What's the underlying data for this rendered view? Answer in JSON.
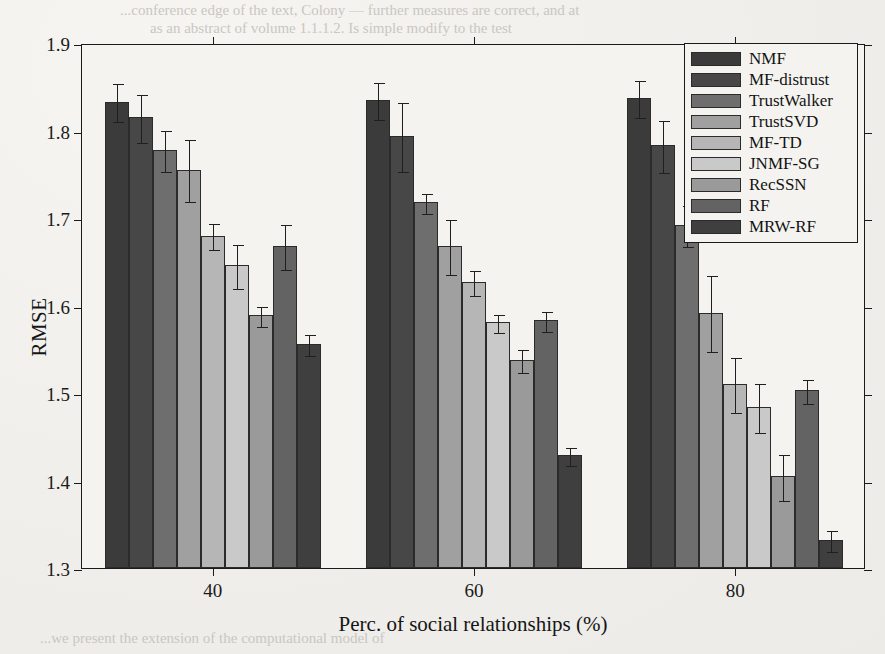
{
  "chart_data": {
    "type": "bar",
    "title": "",
    "xlabel": "Perc. of social relationships (%)",
    "ylabel": "RMSE",
    "ylim": [
      1.3,
      1.9
    ],
    "yticks": [
      "1.3",
      "1.4",
      "1.5",
      "1.6",
      "1.7",
      "1.8",
      "1.9"
    ],
    "categories": [
      "40",
      "60",
      "80"
    ],
    "grid": false,
    "legend_position": "top-right",
    "errorbars": true,
    "series": [
      {
        "name": "NMF",
        "color": "#3b3b3b",
        "values": [
          1.833,
          1.835,
          1.837
        ],
        "errors": [
          0.022,
          0.022,
          0.022
        ]
      },
      {
        "name": "MF-distrust",
        "color": "#474747",
        "values": [
          1.815,
          1.794,
          1.783
        ],
        "errors": [
          0.028,
          0.04,
          0.03
        ]
      },
      {
        "name": "TrustWalker",
        "color": "#6e6e6e",
        "values": [
          1.778,
          1.718,
          1.692
        ],
        "errors": [
          0.024,
          0.012,
          0.024
        ]
      },
      {
        "name": "TrustSVD",
        "color": "#a0a0a0",
        "values": [
          1.755,
          1.668,
          1.592
        ],
        "errors": [
          0.036,
          0.032,
          0.044
        ]
      },
      {
        "name": "MF-TD",
        "color": "#b6b6b6",
        "values": [
          1.68,
          1.627,
          1.51
        ],
        "errors": [
          0.015,
          0.015,
          0.032
        ]
      },
      {
        "name": "JNMF-SG",
        "color": "#c9c9c9",
        "values": [
          1.646,
          1.581,
          1.484
        ],
        "errors": [
          0.026,
          0.011,
          0.029
        ]
      },
      {
        "name": "RecSSN",
        "color": "#9a9a9a",
        "values": [
          1.589,
          1.538,
          1.405
        ],
        "errors": [
          0.012,
          0.014,
          0.027
        ]
      },
      {
        "name": "RF",
        "color": "#636363",
        "values": [
          1.668,
          1.583,
          1.503
        ],
        "errors": [
          0.026,
          0.012,
          0.014
        ]
      },
      {
        "name": "MRW-RF",
        "color": "#3f3f3f",
        "values": [
          1.556,
          1.429,
          1.332
        ],
        "errors": [
          0.013,
          0.011,
          0.013
        ]
      }
    ]
  },
  "page": {
    "ghost_top": "...conference edge of the text, Colony — further measures are correct, and at",
    "ghost_top2": "as an abstract of volume 1.1.1.2. Is simple modify to the test",
    "ghost_mid": "",
    "ghost_bottom": "...we present the extension of the computational model of"
  }
}
